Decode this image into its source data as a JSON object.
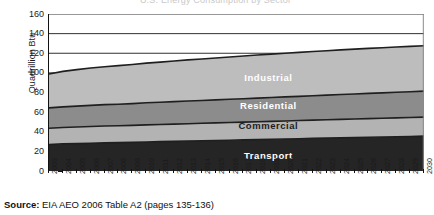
{
  "title_faint": "U.S. Energy Consumption by Sector",
  "source": {
    "prefix": "Source:",
    "text": "EIA AEO 2006 Table A2 (pages 135-136)"
  },
  "chart_data": {
    "type": "area",
    "title": "",
    "xlabel": "",
    "ylabel": "Quadrillion Btu",
    "ylim": [
      0,
      160
    ],
    "ytick_labels": [
      "0",
      "20",
      "40",
      "60",
      "80",
      "100",
      "120",
      "140",
      "160"
    ],
    "yticks": [
      0,
      20,
      40,
      60,
      80,
      100,
      120,
      140,
      160
    ],
    "grid": true,
    "legend": "inline-band-labels",
    "stacked": true,
    "categories": [
      "2003",
      "2004",
      "2005",
      "2006",
      "2007",
      "2008",
      "2009",
      "2010",
      "2011",
      "2012",
      "2013",
      "2014",
      "2015",
      "2016",
      "2017",
      "2018",
      "2019",
      "2020",
      "2021",
      "2022",
      "2023",
      "2024",
      "2025",
      "2026",
      "2027",
      "2028",
      "2029",
      "2030"
    ],
    "series": [
      {
        "name": "Transport",
        "color": "#252525",
        "values": [
          27.0,
          27.6,
          27.9,
          28.3,
          28.7,
          28.9,
          29.2,
          29.6,
          29.9,
          30.2,
          30.5,
          30.8,
          31.1,
          31.4,
          31.7,
          32.0,
          32.3,
          32.6,
          32.9,
          33.2,
          33.5,
          33.8,
          34.1,
          34.4,
          34.6,
          34.9,
          35.2,
          35.5
        ]
      },
      {
        "name": "Commercial",
        "color": "#b3b3b3",
        "values": [
          16.5,
          16.7,
          16.9,
          17.0,
          17.1,
          17.2,
          17.3,
          17.4,
          17.5,
          17.6,
          17.7,
          17.8,
          17.9,
          18.0,
          18.1,
          18.2,
          18.3,
          18.4,
          18.5,
          18.6,
          18.7,
          18.8,
          18.9,
          19.0,
          19.1,
          19.2,
          19.3,
          19.4
        ]
      },
      {
        "name": "Residential",
        "color": "#8c8c8c",
        "values": [
          20.8,
          21.1,
          21.3,
          21.6,
          21.8,
          22.0,
          22.2,
          22.5,
          22.7,
          22.9,
          23.1,
          23.3,
          23.5,
          23.7,
          23.9,
          24.1,
          24.3,
          24.5,
          24.7,
          24.9,
          25.1,
          25.3,
          25.5,
          25.7,
          25.9,
          26.1,
          26.3,
          26.5
        ]
      },
      {
        "name": "Industrial",
        "color": "#bdbdbd",
        "values": [
          34.6,
          36.1,
          37.2,
          38.0,
          38.7,
          39.3,
          39.9,
          40.4,
          40.9,
          41.4,
          41.9,
          42.3,
          42.7,
          43.1,
          43.5,
          43.9,
          44.2,
          44.5,
          44.8,
          45.1,
          45.3,
          45.5,
          45.7,
          45.9,
          46.0,
          46.1,
          46.2,
          46.3
        ]
      }
    ],
    "totals": [
      98.9,
      101.5,
      103.3,
      104.9,
      106.3,
      107.4,
      108.6,
      109.9,
      111.0,
      112.1,
      113.2,
      114.2,
      115.2,
      116.2,
      117.2,
      118.2,
      119.1,
      120.0,
      120.9,
      121.8,
      122.6,
      123.4,
      124.2,
      125.0,
      125.6,
      126.3,
      127.0,
      137.0
    ],
    "band_labels": [
      {
        "name": "Industrial",
        "x_frac": 0.585,
        "value_mid": 95
      },
      {
        "name": "Residential",
        "x_frac": 0.585,
        "value_mid": 66
      },
      {
        "name": "Commercial",
        "x_frac": 0.585,
        "value_mid": 46
      },
      {
        "name": "Transport",
        "x_frac": 0.585,
        "value_mid": 15
      }
    ]
  }
}
